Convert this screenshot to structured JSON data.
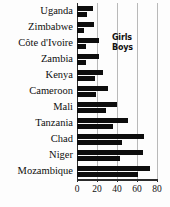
{
  "chart_data": {
    "type": "bar",
    "orientation": "horizontal",
    "title": "",
    "xlabel": "",
    "ylabel": "",
    "xlim": [
      0,
      80
    ],
    "xticks": [
      0,
      20,
      40,
      60,
      80
    ],
    "grid": true,
    "grid_axis": "x",
    "legend_position": "inside-right-upper",
    "categories": [
      "Uganda",
      "Zimbabwe",
      "Côte d'Ivoire",
      "Zambia",
      "Kenya",
      "Cameroon",
      "Mali",
      "Tanzania",
      "Chad",
      "Niger",
      "Mozambique"
    ],
    "series": [
      {
        "name": "Girls",
        "color": "#0d0d0d",
        "values": [
          16,
          17,
          22,
          22,
          26,
          31,
          40,
          51,
          67,
          66,
          73
        ]
      },
      {
        "name": "Boys",
        "color": "#0d0d0d",
        "values": [
          10,
          7,
          9,
          9,
          18,
          19,
          29,
          36,
          45,
          43,
          61
        ]
      }
    ]
  },
  "legend": {
    "entries": [
      "Girls",
      "Boys"
    ]
  },
  "axis": {
    "tick_labels": [
      "0",
      "20",
      "40",
      "60",
      "80"
    ]
  }
}
